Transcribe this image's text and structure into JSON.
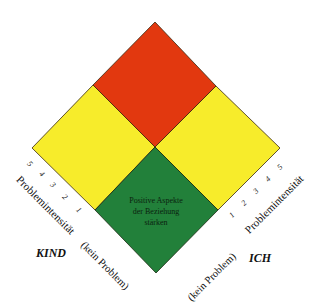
{
  "colors": {
    "red": "#e2380f",
    "yellow": "#f7ec2b",
    "green": "#22803a",
    "outline": "#3a2a10"
  },
  "quadrants": {
    "top": {
      "color_name": "red"
    },
    "left": {
      "color_name": "yellow"
    },
    "right": {
      "color_name": "yellow"
    },
    "bottom": {
      "color_name": "green",
      "text_lines": [
        "Positive Aspekte",
        "der Beziehung",
        "stärken"
      ]
    }
  },
  "left_axis": {
    "title": "Problemintensität",
    "ticks": [
      "1",
      "2",
      "3",
      "4",
      "5"
    ],
    "zero_label": "(kein Problem)",
    "side_name": "KIND"
  },
  "right_axis": {
    "title": "Problemintensität",
    "ticks": [
      "1",
      "2",
      "3",
      "4",
      "5"
    ],
    "zero_label": "(kein Problem)",
    "side_name": "ICH"
  }
}
